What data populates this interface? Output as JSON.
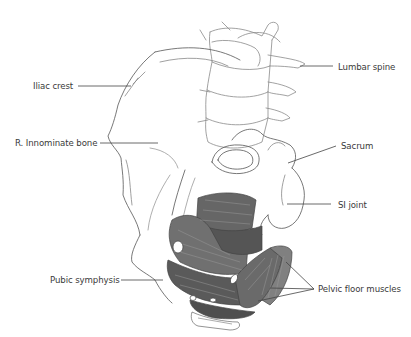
{
  "figure": {
    "colors": {
      "outline": "#555555",
      "muscle_dark": "#5e5e5e",
      "muscle_mid": "#7a7a7a",
      "muscle_light": "#9a9a9a",
      "label_text": "#3a3a3a",
      "leader_line": "#444444"
    }
  },
  "labels": [
    {
      "id": "iliac-crest",
      "text": "Iliac crest",
      "x": 33,
      "y": 81
    },
    {
      "id": "innominate-bone",
      "text": "R. Innominate bone",
      "x": 15,
      "y": 138
    },
    {
      "id": "lumbar-spine",
      "text": "Lumbar spine",
      "x": 338,
      "y": 62
    },
    {
      "id": "sacrum",
      "text": "Sacrum",
      "x": 341,
      "y": 141
    },
    {
      "id": "si-joint",
      "text": "SI joint",
      "x": 338,
      "y": 200
    },
    {
      "id": "pubic-symphysis",
      "text": "Pubic symphysis",
      "x": 50,
      "y": 275
    },
    {
      "id": "pelvic-floor-muscles",
      "text": "Pelvic floor muscles",
      "x": 318,
      "y": 284
    }
  ]
}
